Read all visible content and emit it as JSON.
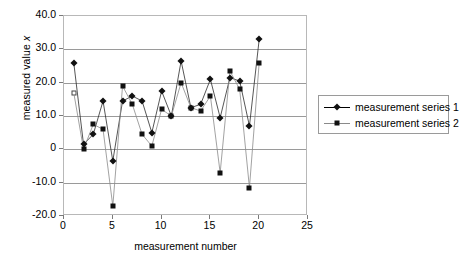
{
  "chart_data": {
    "type": "line",
    "title": "",
    "xlabel": "measurement number",
    "ylabel": "measured value x",
    "xlim": [
      0,
      25
    ],
    "ylim": [
      -20,
      40
    ],
    "xticks": [
      0,
      5,
      10,
      15,
      20,
      25
    ],
    "xtick_labels": [
      "0",
      "5",
      "10",
      "15",
      "20",
      "25"
    ],
    "yticks": [
      -20,
      -10,
      0,
      10,
      20,
      30,
      40
    ],
    "ytick_labels": [
      "-20.0",
      "-10.0",
      "0",
      "10.0",
      "20.0",
      "30.0",
      "40.0"
    ],
    "grid": true,
    "legend_position": "right",
    "x": [
      1,
      2,
      3,
      4,
      5,
      6,
      7,
      8,
      9,
      10,
      11,
      12,
      13,
      14,
      15,
      16,
      17,
      18,
      19,
      20
    ],
    "series": [
      {
        "name": "measurement series 1",
        "marker": "diamond",
        "color": "#111111",
        "values": [
          26.0,
          1.5,
          4.5,
          14.5,
          -3.5,
          14.5,
          16.0,
          14.5,
          5.0,
          17.5,
          10.0,
          26.5,
          12.5,
          13.5,
          21.0,
          9.5,
          21.5,
          20.5,
          7.0,
          33.0
        ]
      },
      {
        "name": "measurement series 2",
        "marker": "square",
        "color": "#111111",
        "values": [
          17.0,
          0.0,
          7.5,
          6.0,
          -17.0,
          19.0,
          13.5,
          4.5,
          1.0,
          12.0,
          10.0,
          20.0,
          12.5,
          11.5,
          16.0,
          -7.0,
          23.5,
          18.0,
          -11.5,
          26.0
        ]
      }
    ]
  },
  "axes": {
    "ylabel_prefix": "measured value ",
    "ylabel_italic": "x",
    "xlabel": "measurement number"
  },
  "legend": {
    "items": [
      {
        "label": "measurement series 1"
      },
      {
        "label": "measurement series 2"
      }
    ]
  }
}
